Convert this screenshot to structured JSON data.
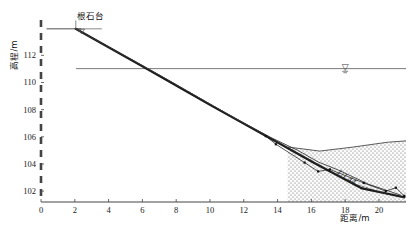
{
  "chart_data": {
    "type": "line",
    "title": "",
    "xlabel": "距离/m",
    "ylabel": "高程/m",
    "xlim": [
      0,
      21.6
    ],
    "ylim": [
      101.2,
      114.6
    ],
    "xticks": [
      0,
      2,
      4,
      6,
      8,
      10,
      12,
      14,
      16,
      18,
      20
    ],
    "xtick_labels": [
      "0",
      "2",
      "4",
      "6",
      "8",
      "10",
      "12",
      "14",
      "16",
      "18",
      "20"
    ],
    "yticks": [
      102,
      104,
      106,
      108,
      110,
      112
    ],
    "ytick_labels": [
      "102",
      "104",
      "106",
      "108",
      "110",
      "112"
    ],
    "grid": false,
    "legend": "none",
    "annotations": [
      {
        "name": "stone-platform-label",
        "text": "根石台",
        "x": 2.0,
        "y": 114.35
      },
      {
        "name": "slope-ratio-label",
        "text": "1:1.44",
        "x": 18.0,
        "y": 102.9
      },
      {
        "name": "water-level-symbol",
        "text": "▽",
        "x": 18.0,
        "y": 111.0
      }
    ],
    "series": [
      {
        "name": "根石台顶面",
        "style": "solid-thin",
        "x": [
          0.35,
          2.35
        ],
        "y": [
          113.95,
          113.95
        ]
      },
      {
        "name": "水位线",
        "style": "solid-thin",
        "x": [
          2.1,
          21.6
        ],
        "y": [
          111.02,
          111.02
        ]
      },
      {
        "name": "原始坡面线",
        "style": "solid-thick",
        "x": [
          2.05,
          6.0,
          10.0,
          13.4,
          16.2,
          19.0,
          21.5
        ],
        "y": [
          113.95,
          111.2,
          108.35,
          106.0,
          104.05,
          102.2,
          101.55
        ]
      },
      {
        "name": "坍塌后坡面线",
        "style": "solid-thin",
        "x": [
          2.05,
          7.0,
          11.5,
          13.6,
          15.2,
          16.4,
          17.6,
          19.4,
          21.3
        ],
        "y": [
          113.95,
          110.55,
          107.35,
          105.95,
          105.0,
          104.15,
          103.55,
          102.5,
          101.7
        ]
      },
      {
        "name": "设计坡面线",
        "style": "dashed-thin",
        "x": [
          2.05,
          7.5,
          12.0,
          14.6,
          16.5,
          18.4,
          20.4,
          21.5
        ],
        "y": [
          113.95,
          110.2,
          107.0,
          105.2,
          103.9,
          102.6,
          101.8,
          101.5
        ]
      },
      {
        "name": "根石走失线",
        "style": "marker-line",
        "x": [
          13.3,
          13.9,
          15.6,
          16.4,
          17.1,
          19.1,
          20.4,
          21.0,
          21.5
        ],
        "y": [
          106.05,
          105.45,
          104.1,
          103.45,
          103.6,
          102.6,
          102.0,
          102.25,
          101.65
        ]
      },
      {
        "name": "河床淤积面",
        "style": "solid-thin",
        "x": [
          14.6,
          16.5,
          18.5,
          20.5,
          21.6
        ],
        "y": [
          105.25,
          104.95,
          105.25,
          105.6,
          105.7
        ]
      }
    ],
    "filled_regions": [
      {
        "name": "河床淤积区",
        "pattern": "stipple",
        "fill_color": "#f2f2f2",
        "dot_color": "#5a5a5a",
        "description": "Stippled sediment / riverbed deposit region below the bed surface line on the right of the section."
      }
    ],
    "markers": {
      "shape": "square",
      "color": "#111111",
      "size": 2.2
    }
  },
  "style": {
    "axis_color": "#444444",
    "text_color": "#111111",
    "thick_line_color": "#1a1a1a",
    "thin_line_color": "#333333",
    "water_line_color": "#6b6b6b",
    "background": "#ffffff"
  }
}
